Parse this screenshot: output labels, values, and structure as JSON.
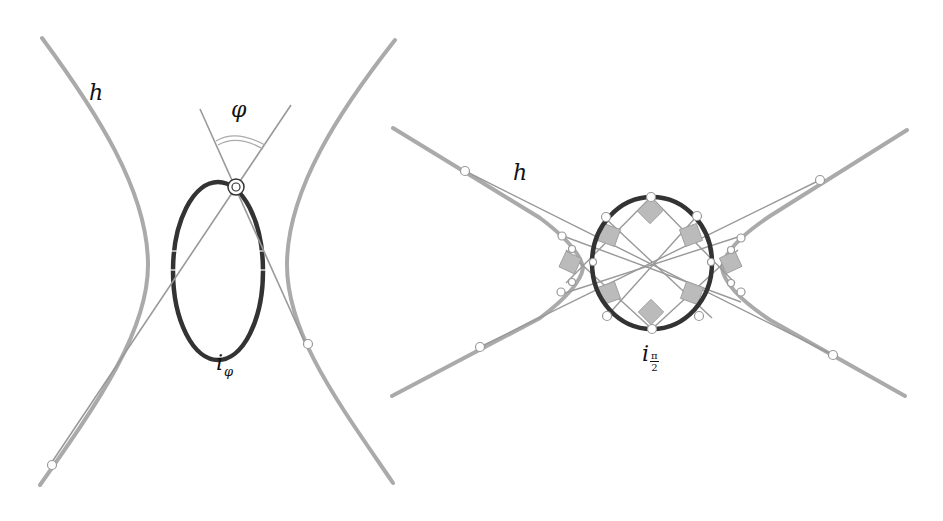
{
  "figure": {
    "left_panel": {
      "curve_label": "h",
      "angle_label": "φ",
      "ellipse_label_base": "i",
      "ellipse_label_subscript": "φ"
    },
    "right_panel": {
      "curve_label": "h",
      "ellipse_label_base": "i",
      "ellipse_label_sub_numerator": "π",
      "ellipse_label_sub_denominator": "2"
    }
  },
  "colors": {
    "hyperbola": "#aaaaaa",
    "ellipse": "#333333",
    "tangent_lines": "#999999",
    "squares_fill": "#bbbbbb",
    "points_fill": "#ffffff"
  }
}
